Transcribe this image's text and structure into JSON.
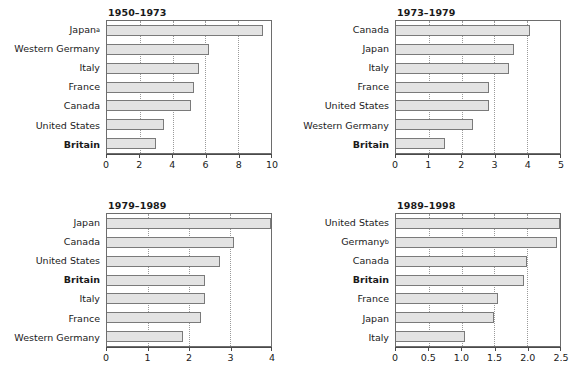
{
  "chart_data": [
    {
      "type": "bar",
      "orientation": "horizontal",
      "title": "1950–1973",
      "xlabel": "",
      "ylabel": "",
      "xlim": [
        0,
        10
      ],
      "ticks": [
        "0",
        "2",
        "4",
        "6",
        "8",
        "10"
      ],
      "tick_values": [
        0,
        2,
        4,
        6,
        8,
        10
      ],
      "grid": true,
      "categories": [
        "Japanᵃ",
        "Western Germany",
        "Italy",
        "France",
        "Canada",
        "United States",
        "Britain"
      ],
      "category_plain": [
        "Japan",
        "Western Germany",
        "Italy",
        "France",
        "Canada",
        "United States",
        "Britain"
      ],
      "superscripts": [
        "a",
        "",
        "",
        "",
        "",
        "",
        ""
      ],
      "highlight": "Britain",
      "values": [
        9.5,
        6.2,
        5.6,
        5.3,
        5.1,
        3.5,
        3.0
      ]
    },
    {
      "type": "bar",
      "orientation": "horizontal",
      "title": "1973–1979",
      "xlabel": "",
      "ylabel": "",
      "xlim": [
        0,
        5
      ],
      "ticks": [
        "0",
        "1",
        "2",
        "3",
        "4",
        "5"
      ],
      "tick_values": [
        0,
        1,
        2,
        3,
        4,
        5
      ],
      "grid": true,
      "categories": [
        "Canada",
        "Japan",
        "Italy",
        "France",
        "United States",
        "Western Germany",
        "Britain"
      ],
      "category_plain": [
        "Canada",
        "Japan",
        "Italy",
        "France",
        "United States",
        "Western Germany",
        "Britain"
      ],
      "superscripts": [
        "",
        "",
        "",
        "",
        "",
        "",
        ""
      ],
      "highlight": "Britain",
      "values": [
        4.1,
        3.6,
        3.45,
        2.85,
        2.85,
        2.35,
        1.5
      ]
    },
    {
      "type": "bar",
      "orientation": "horizontal",
      "title": "1979–1989",
      "xlabel": "",
      "ylabel": "",
      "xlim": [
        0,
        4
      ],
      "ticks": [
        "0",
        "1",
        "2",
        "3",
        "4"
      ],
      "tick_values": [
        0,
        1,
        2,
        3,
        4
      ],
      "grid": true,
      "categories": [
        "Japan",
        "Canada",
        "United States",
        "Britain",
        "Italy",
        "France",
        "Western Germany"
      ],
      "category_plain": [
        "Japan",
        "Canada",
        "United States",
        "Britain",
        "Italy",
        "France",
        "Western Germany"
      ],
      "superscripts": [
        "",
        "",
        "",
        "",
        "",
        "",
        ""
      ],
      "highlight": "Britain",
      "values": [
        4.0,
        3.1,
        2.75,
        2.4,
        2.4,
        2.3,
        1.85
      ]
    },
    {
      "type": "bar",
      "orientation": "horizontal",
      "title": "1989–1998",
      "xlabel": "",
      "ylabel": "",
      "xlim": [
        0,
        2.5
      ],
      "ticks": [
        "0",
        "0.5",
        "1.0",
        "1.5",
        "2.0",
        "2.5"
      ],
      "tick_values": [
        0,
        0.5,
        1.0,
        1.5,
        2.0,
        2.5
      ],
      "grid": true,
      "categories": [
        "United States",
        "Germanyᵇ",
        "Canada",
        "Britain",
        "France",
        "Japan",
        "Italy"
      ],
      "category_plain": [
        "United States",
        "Germany",
        "Canada",
        "Britain",
        "France",
        "Japan",
        "Italy"
      ],
      "superscripts": [
        "",
        "b",
        "",
        "",
        "",
        "",
        ""
      ],
      "highlight": "Britain",
      "values": [
        2.5,
        2.45,
        2.0,
        1.95,
        1.55,
        1.5,
        1.05
      ]
    }
  ],
  "style": {
    "bar_fill": "#e3e3e3",
    "bar_border": "#7a7a7a",
    "frame": "#6d6d6d",
    "gridline": "#9a9a9a",
    "text": "#1a1a1a",
    "background": "#ffffff"
  }
}
